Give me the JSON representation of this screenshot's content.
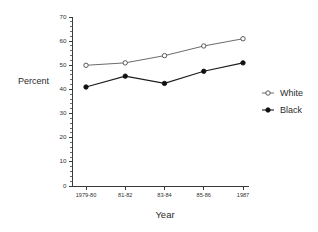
{
  "chart_data": {
    "type": "line",
    "title": "",
    "subtitle": "",
    "xlabel": "Year",
    "ylabel": "Percent",
    "categories": [
      "1979-80",
      "81-82",
      "83-84",
      "85-86",
      "1987"
    ],
    "series": [
      {
        "name": "White",
        "marker": "open-circle",
        "color": "#5a5a5a",
        "values": [
          50,
          51,
          54,
          58,
          61
        ]
      },
      {
        "name": "Black",
        "marker": "filled-circle",
        "color": "#111111",
        "values": [
          41,
          45.5,
          42.5,
          47.5,
          51
        ]
      }
    ],
    "ylim": [
      0,
      70
    ],
    "ytick_labels": [
      "0",
      "10",
      "20",
      "30",
      "40",
      "50",
      "60",
      "70"
    ],
    "ytick_values": [
      0,
      10,
      20,
      30,
      40,
      50,
      60,
      70
    ],
    "yminor_step": 2,
    "grid": false,
    "legend_position": "right",
    "legend": [
      {
        "label": "White",
        "marker": "open-circle"
      },
      {
        "label": "Black",
        "marker": "filled-circle"
      }
    ]
  },
  "colors": {
    "background": "#ffffff",
    "axis": "#3a3a3a",
    "text": "#2b2b2b",
    "white_series": "#5a5a5a",
    "black_series": "#111111"
  }
}
